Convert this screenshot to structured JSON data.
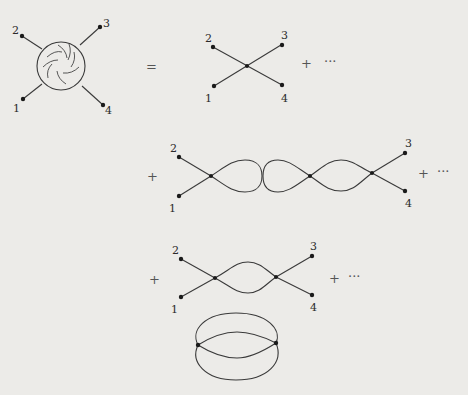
{
  "figure": {
    "type": "feynman-diagram-expansion",
    "blob": {
      "description": "four-point function blob with swirl pattern",
      "external_labels": [
        "1",
        "2",
        "3",
        "4"
      ]
    },
    "equals_sign": "=",
    "plus_sign": "+",
    "ellipsis": "···",
    "rows": [
      {
        "name": "tree-level-vertex",
        "external_labels": {
          "top_left": "2",
          "top_right": "3",
          "bottom_left": "1",
          "bottom_right": "4"
        },
        "trailing": "+ ···"
      },
      {
        "name": "one-loop-tadpole-and-double-bubble",
        "leading": "+",
        "external_labels": {
          "top_left": "2",
          "top_right": "3",
          "bottom_left": "1",
          "bottom_right": "4"
        },
        "trailing": "+ ···"
      },
      {
        "name": "one-loop-bubble",
        "leading": "+",
        "external_labels": {
          "top_left": "2",
          "top_right": "3",
          "bottom_left": "1",
          "bottom_right": "4"
        },
        "trailing": "+ ···"
      },
      {
        "name": "vacuum-bubble",
        "description": "two vertices connected by four propagators"
      }
    ]
  }
}
